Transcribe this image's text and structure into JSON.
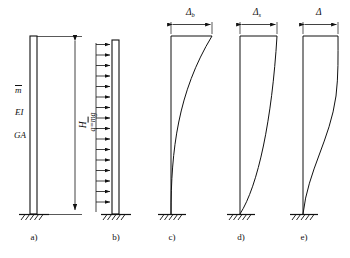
{
  "figure": {
    "type": "structural-engineering-diagram",
    "stroke_color": "#111111",
    "background_color": "#ffffff"
  },
  "panels": [
    {
      "id": "a",
      "label": "a)",
      "caption": "Cantilever column model",
      "properties": [
        {
          "name": "mass-per-length",
          "text": "m",
          "overbar": true
        },
        {
          "name": "flexural-rigidity",
          "text": "EI",
          "overbar": false
        },
        {
          "name": "shear-rigidity",
          "text": "GA",
          "overbar": false
        }
      ],
      "dimension": {
        "name": "height",
        "text": "H"
      }
    },
    {
      "id": "b",
      "label": "b)",
      "caption": "Uniformly distributed lateral load",
      "load": {
        "name": "distributed-load",
        "symbol": "q",
        "equals": "=",
        "value": "m",
        "overbar": true,
        "suffix": "g",
        "arrow_count": 16,
        "direction": "right"
      }
    },
    {
      "id": "c",
      "label": "c)",
      "caption": "Bending deflection",
      "deflection": {
        "name": "bending-deflection",
        "symbol": "Δ",
        "subscript": "b"
      },
      "curve": "bending"
    },
    {
      "id": "d",
      "label": "d)",
      "caption": "Shear deflection",
      "deflection": {
        "name": "shear-deflection",
        "symbol": "Δ",
        "subscript": "s"
      },
      "curve": "shear"
    },
    {
      "id": "e",
      "label": "e)",
      "caption": "Total deflection",
      "deflection": {
        "name": "total-deflection",
        "symbol": "Δ",
        "subscript": ""
      },
      "curve": "combined"
    }
  ]
}
